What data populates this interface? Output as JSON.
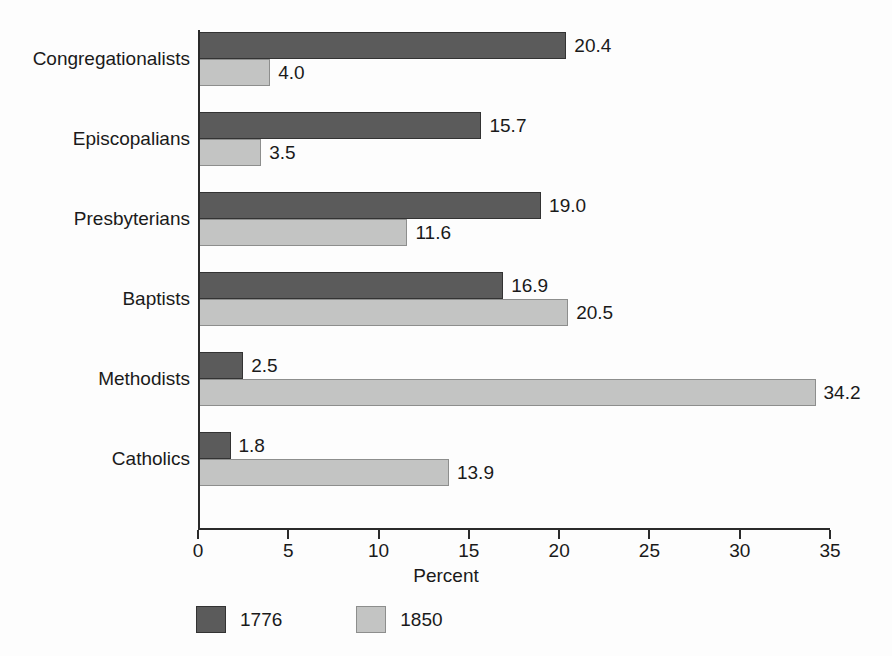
{
  "chart_data": {
    "type": "bar",
    "orientation": "horizontal",
    "title": "",
    "xlabel": "Percent",
    "ylabel": "",
    "xlim": [
      0,
      35
    ],
    "xticks": [
      0,
      5,
      10,
      15,
      20,
      25,
      30,
      35
    ],
    "xtick_labels": [
      "0",
      "5",
      "10",
      "15",
      "20",
      "25",
      "30",
      "35"
    ],
    "grid": false,
    "legend_position": "bottom",
    "categories": [
      "Congregationalists",
      "Episcopalians",
      "Presbyterians",
      "Baptists",
      "Methodists",
      "Catholics"
    ],
    "series": [
      {
        "name": "1776",
        "color": "#5b5b5b",
        "values": [
          20.4,
          15.7,
          19.0,
          16.9,
          2.5,
          1.8
        ],
        "value_labels": [
          "20.4",
          "15.7",
          "19.0",
          "16.9",
          "2.5",
          "1.8"
        ]
      },
      {
        "name": "1850",
        "color": "#c3c4c3",
        "values": [
          4.0,
          3.5,
          11.6,
          20.5,
          34.2,
          13.9
        ],
        "value_labels": [
          "4.0",
          "3.5",
          "11.6",
          "20.5",
          "34.2",
          "13.9"
        ]
      }
    ]
  },
  "legend": {
    "items": [
      {
        "label": "1776",
        "color": "#5b5b5b"
      },
      {
        "label": "1850",
        "color": "#c3c4c3"
      }
    ]
  },
  "axis": {
    "x_title": "Percent"
  }
}
